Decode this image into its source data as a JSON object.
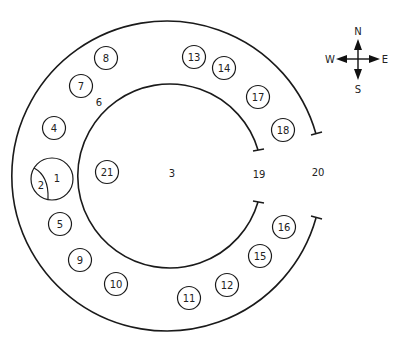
{
  "diagram": {
    "type": "ring-layout-floor-plan",
    "colors": {
      "line": "#1a1a1a",
      "text": "#222222",
      "background": "#ffffff"
    },
    "numbered_circles": [
      {
        "label": "8",
        "x": 106,
        "y": 58
      },
      {
        "label": "13",
        "x": 194,
        "y": 57
      },
      {
        "label": "14",
        "x": 224,
        "y": 68
      },
      {
        "label": "7",
        "x": 81,
        "y": 86
      },
      {
        "label": "17",
        "x": 258,
        "y": 97
      },
      {
        "label": "4",
        "x": 54,
        "y": 128
      },
      {
        "label": "18",
        "x": 283,
        "y": 130
      },
      {
        "label": "21",
        "x": 107,
        "y": 172
      },
      {
        "label": "5",
        "x": 60,
        "y": 224
      },
      {
        "label": "16",
        "x": 284,
        "y": 227
      },
      {
        "label": "9",
        "x": 80,
        "y": 260
      },
      {
        "label": "15",
        "x": 260,
        "y": 256
      },
      {
        "label": "10",
        "x": 116,
        "y": 284
      },
      {
        "label": "12",
        "x": 227,
        "y": 285
      },
      {
        "label": "11",
        "x": 189,
        "y": 298
      }
    ],
    "split_circle": {
      "label_large": "1",
      "label_small": "2"
    },
    "free_labels": [
      {
        "label": "6",
        "x": 99,
        "y": 102
      },
      {
        "label": "3",
        "x": 172,
        "y": 173
      },
      {
        "label": "19",
        "x": 259,
        "y": 174
      },
      {
        "label": "20",
        "x": 318,
        "y": 172
      }
    ],
    "compass": {
      "north": "N",
      "south": "S",
      "east": "E",
      "west": "W"
    }
  }
}
